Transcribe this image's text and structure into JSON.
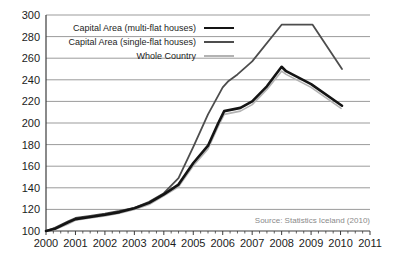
{
  "chart_data": {
    "type": "line",
    "title": "",
    "xlabel": "",
    "ylabel": "",
    "xlim": [
      2000,
      2011
    ],
    "ylim": [
      100,
      300
    ],
    "y_tick_step": 20,
    "x_ticks": [
      2000,
      2001,
      2002,
      2003,
      2004,
      2005,
      2006,
      2007,
      2008,
      2009,
      2010,
      2011
    ],
    "minor_ticks_per_year": 4,
    "grid": "horizontal",
    "legend_position": "top-left-inside",
    "source": "Source: Statistics Iceland (2010)",
    "series": [
      {
        "name": "Capital Area (multi-flat houses)",
        "color": "#141414",
        "width": 2.6,
        "points": [
          [
            2000,
            100
          ],
          [
            2000.3,
            102
          ],
          [
            2000.75,
            108
          ],
          [
            2001,
            111
          ],
          [
            2001.5,
            113
          ],
          [
            2002,
            115
          ],
          [
            2002.5,
            117.5
          ],
          [
            2003,
            121
          ],
          [
            2003.5,
            126
          ],
          [
            2004,
            134
          ],
          [
            2004.5,
            143
          ],
          [
            2005,
            163
          ],
          [
            2005.5,
            179
          ],
          [
            2005.85,
            200
          ],
          [
            2006.05,
            211
          ],
          [
            2006.6,
            214
          ],
          [
            2007,
            220
          ],
          [
            2007.5,
            234
          ],
          [
            2008,
            252
          ],
          [
            2008.15,
            248
          ],
          [
            2009,
            236
          ],
          [
            2010.05,
            216
          ]
        ]
      },
      {
        "name": "Capital Area (single-flat houses)",
        "color": "#4d4d4d",
        "width": 1.8,
        "points": [
          [
            2000,
            100
          ],
          [
            2000.3,
            103
          ],
          [
            2000.75,
            109
          ],
          [
            2001,
            112
          ],
          [
            2001.5,
            114
          ],
          [
            2002,
            116
          ],
          [
            2002.5,
            118.5
          ],
          [
            2003,
            121.5
          ],
          [
            2003.5,
            127
          ],
          [
            2004,
            135
          ],
          [
            2004.5,
            149
          ],
          [
            2005,
            178
          ],
          [
            2005.5,
            208
          ],
          [
            2006,
            233
          ],
          [
            2006.2,
            239
          ],
          [
            2006.5,
            245
          ],
          [
            2007,
            257
          ],
          [
            2008,
            291
          ],
          [
            2009.05,
            291
          ],
          [
            2010.05,
            250
          ]
        ]
      },
      {
        "name": "Whole Country",
        "color": "#b3b3b3",
        "width": 1.6,
        "points": [
          [
            2000,
            100
          ],
          [
            2000.3,
            101.5
          ],
          [
            2000.75,
            106.5
          ],
          [
            2001,
            110
          ],
          [
            2001.5,
            112
          ],
          [
            2002,
            114
          ],
          [
            2002.5,
            116.5
          ],
          [
            2003,
            120
          ],
          [
            2003.5,
            124.5
          ],
          [
            2004,
            132.5
          ],
          [
            2004.5,
            141
          ],
          [
            2005,
            160.5
          ],
          [
            2005.5,
            176
          ],
          [
            2005.85,
            197
          ],
          [
            2006.05,
            208
          ],
          [
            2006.6,
            211
          ],
          [
            2007,
            217
          ],
          [
            2007.5,
            231
          ],
          [
            2008,
            248
          ],
          [
            2008.15,
            245
          ],
          [
            2009,
            233
          ],
          [
            2010.02,
            213.5
          ]
        ]
      }
    ]
  },
  "colors": {
    "background": "#ffffff",
    "gridline": "#9b9b9b",
    "axis": "#3c3c3c",
    "tick_label": "#1c1c1c",
    "legend_text": "#1c1c1c",
    "source_text": "#8a8a8a"
  }
}
